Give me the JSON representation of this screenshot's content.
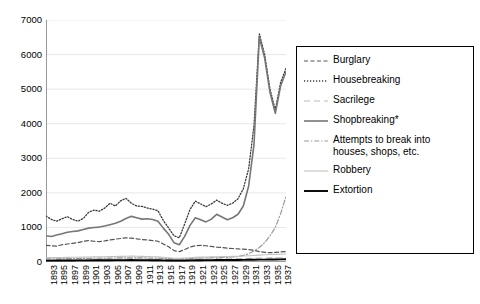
{
  "chart_data": {
    "type": "line",
    "title": "",
    "subtitle": "",
    "xlabel": "",
    "ylabel": "",
    "xlim": [
      1893,
      1938
    ],
    "ylim": [
      0,
      7000
    ],
    "ytick_step": 1000,
    "grid": "horizontal",
    "legend_position": "right",
    "yticks": [
      0,
      1000,
      2000,
      3000,
      4000,
      5000,
      6000,
      7000
    ],
    "x": [
      1893,
      1894,
      1895,
      1896,
      1897,
      1898,
      1899,
      1900,
      1901,
      1902,
      1903,
      1904,
      1905,
      1906,
      1907,
      1908,
      1909,
      1910,
      1911,
      1912,
      1913,
      1914,
      1915,
      1916,
      1917,
      1918,
      1919,
      1920,
      1921,
      1922,
      1923,
      1924,
      1925,
      1926,
      1927,
      1928,
      1929,
      1930,
      1931,
      1932,
      1933,
      1934,
      1935,
      1936,
      1937,
      1938
    ],
    "xtick_labels": [
      "1893",
      "1895",
      "1897",
      "1899",
      "1901",
      "1903",
      "1905",
      "1907",
      "1909",
      "1911",
      "1913",
      "1915",
      "1917",
      "1919",
      "1921",
      "1923",
      "1925",
      "1927",
      "1929",
      "1931",
      "1933",
      "1935",
      "1937"
    ],
    "series": [
      {
        "name": "Burglary",
        "style": "dashed",
        "color": "#555555",
        "width": 1.2,
        "values": [
          480,
          470,
          460,
          500,
          520,
          540,
          560,
          600,
          620,
          600,
          590,
          610,
          640,
          660,
          680,
          700,
          690,
          670,
          650,
          640,
          620,
          600,
          520,
          440,
          330,
          300,
          360,
          430,
          470,
          480,
          470,
          450,
          430,
          420,
          400,
          390,
          380,
          370,
          360,
          340,
          300,
          280,
          270,
          280,
          290,
          300
        ]
      },
      {
        "name": "Housebreaking",
        "style": "dotted",
        "color": "#3a3a3a",
        "width": 1.3,
        "values": [
          1330,
          1230,
          1180,
          1250,
          1310,
          1230,
          1180,
          1260,
          1440,
          1500,
          1470,
          1560,
          1700,
          1620,
          1770,
          1840,
          1700,
          1620,
          1610,
          1560,
          1530,
          1480,
          1200,
          980,
          760,
          700,
          1100,
          1520,
          1760,
          1680,
          1600,
          1680,
          1790,
          1700,
          1640,
          1700,
          1830,
          2120,
          2700,
          3950,
          6600,
          6000,
          5000,
          4400,
          5200,
          5600
        ]
      },
      {
        "name": "Sacrilege",
        "style": "longdash",
        "color": "#bbbbbb",
        "width": 1.1,
        "values": [
          60,
          62,
          64,
          66,
          68,
          70,
          72,
          74,
          76,
          78,
          80,
          82,
          84,
          86,
          88,
          90,
          92,
          90,
          88,
          86,
          84,
          82,
          78,
          74,
          70,
          68,
          72,
          76,
          80,
          84,
          86,
          88,
          90,
          92,
          94,
          96,
          98,
          100,
          104,
          108,
          112,
          116,
          118,
          120,
          122,
          124
        ]
      },
      {
        "name": "Shopbreaking*",
        "style": "solid",
        "color": "#767676",
        "width": 1.6,
        "values": [
          760,
          740,
          780,
          820,
          860,
          880,
          900,
          940,
          980,
          1000,
          1010,
          1040,
          1080,
          1120,
          1180,
          1260,
          1320,
          1280,
          1240,
          1250,
          1230,
          1180,
          980,
          800,
          560,
          500,
          740,
          1060,
          1280,
          1220,
          1160,
          1240,
          1380,
          1300,
          1220,
          1280,
          1380,
          1620,
          2200,
          3400,
          6500,
          5900,
          4900,
          4300,
          5100,
          5500
        ]
      },
      {
        "name": "Attempts to break into houses, shops, etc.",
        "style": "dashdot",
        "color": "#9a9a9a",
        "width": 1.2,
        "values": [
          90,
          92,
          94,
          96,
          98,
          100,
          102,
          104,
          106,
          108,
          110,
          112,
          114,
          116,
          118,
          120,
          122,
          120,
          118,
          116,
          114,
          112,
          104,
          96,
          88,
          84,
          92,
          100,
          108,
          116,
          120,
          124,
          128,
          132,
          136,
          144,
          160,
          190,
          240,
          320,
          420,
          560,
          760,
          1000,
          1400,
          1900
        ]
      },
      {
        "name": "Robbery",
        "style": "solid",
        "color": "#c2c2c2",
        "width": 1.1,
        "values": [
          130,
          128,
          126,
          130,
          134,
          136,
          138,
          142,
          146,
          148,
          150,
          152,
          156,
          160,
          164,
          168,
          170,
          166,
          162,
          158,
          154,
          150,
          136,
          122,
          108,
          104,
          114,
          124,
          134,
          140,
          144,
          148,
          152,
          156,
          158,
          162,
          166,
          172,
          180,
          190,
          200,
          210,
          216,
          220,
          226,
          232
        ]
      },
      {
        "name": "Extortion",
        "style": "solid",
        "color": "#000000",
        "width": 1.9,
        "values": [
          40,
          41,
          42,
          43,
          44,
          45,
          46,
          47,
          48,
          49,
          50,
          51,
          52,
          53,
          54,
          55,
          56,
          55,
          54,
          53,
          52,
          51,
          48,
          45,
          42,
          41,
          44,
          47,
          50,
          52,
          54,
          55,
          56,
          57,
          58,
          59,
          60,
          62,
          64,
          66,
          68,
          70,
          72,
          74,
          76,
          78
        ]
      }
    ]
  },
  "legend": {
    "items": [
      {
        "label": "Burglary"
      },
      {
        "label": "Housebreaking"
      },
      {
        "label": "Sacrilege"
      },
      {
        "label": "Shopbreaking*"
      },
      {
        "label": "Attempts to break into houses, shops, etc."
      },
      {
        "label": "Robbery"
      },
      {
        "label": "Extortion"
      }
    ]
  }
}
